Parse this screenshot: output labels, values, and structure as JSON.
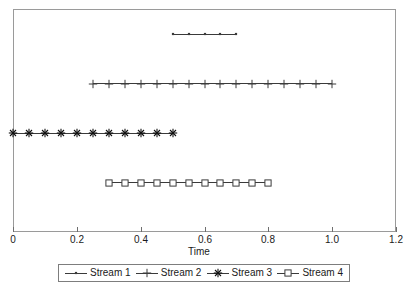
{
  "chart_data": {
    "type": "scatter",
    "title": "",
    "subtitle": "",
    "xlabel": "Time",
    "ylabel": "",
    "xlim": [
      0,
      1.2
    ],
    "ylim": [
      0,
      4.5
    ],
    "grid": false,
    "legend_position": "bottom",
    "x_ticks": [
      {
        "value": 0,
        "label": "0"
      },
      {
        "value": 0.2,
        "label": "0.2"
      },
      {
        "value": 0.4,
        "label": "0.4"
      },
      {
        "value": 0.6,
        "label": "0.6"
      },
      {
        "value": 0.8,
        "label": "0.8"
      },
      {
        "value": 1.0,
        "label": "1.0"
      },
      {
        "value": 1.2,
        "label": "1.2"
      }
    ],
    "y_ticks": [],
    "line_color": "#3a3a3a",
    "frame_color": "#9a9a9a",
    "series": [
      {
        "name": "Stream 1",
        "marker": "point",
        "y": 4,
        "x_start": 0.5,
        "x_end": 0.7,
        "x_step": 0.05,
        "x": [
          0.5,
          0.55,
          0.6,
          0.65,
          0.7
        ],
        "values": [
          4,
          4,
          4,
          4,
          4
        ]
      },
      {
        "name": "Stream 2",
        "marker": "plus",
        "y": 3,
        "x_start": 0.25,
        "x_end": 1.0,
        "x_step": 0.05,
        "x": [
          0.25,
          0.3,
          0.35,
          0.4,
          0.45,
          0.5,
          0.55,
          0.6,
          0.65,
          0.7,
          0.75,
          0.8,
          0.85,
          0.9,
          0.95,
          1.0
        ],
        "values": [
          3,
          3,
          3,
          3,
          3,
          3,
          3,
          3,
          3,
          3,
          3,
          3,
          3,
          3,
          3,
          3
        ]
      },
      {
        "name": "Stream 3",
        "marker": "asterisk",
        "y": 2,
        "x_start": 0.0,
        "x_end": 0.5,
        "x_step": 0.05,
        "x": [
          0.0,
          0.05,
          0.1,
          0.15,
          0.2,
          0.25,
          0.3,
          0.35,
          0.4,
          0.45,
          0.5
        ],
        "values": [
          2,
          2,
          2,
          2,
          2,
          2,
          2,
          2,
          2,
          2,
          2
        ]
      },
      {
        "name": "Stream 4",
        "marker": "square",
        "y": 1,
        "x_start": 0.3,
        "x_end": 0.8,
        "x_step": 0.05,
        "x": [
          0.3,
          0.35,
          0.4,
          0.45,
          0.5,
          0.55,
          0.6,
          0.65,
          0.7,
          0.75,
          0.8
        ],
        "values": [
          1,
          1,
          1,
          1,
          1,
          1,
          1,
          1,
          1,
          1,
          1
        ]
      }
    ],
    "legend": [
      {
        "label": "Stream 1",
        "marker": "point"
      },
      {
        "label": "Stream 2",
        "marker": "plus"
      },
      {
        "label": "Stream 3",
        "marker": "asterisk"
      },
      {
        "label": "Stream 4",
        "marker": "square"
      }
    ]
  }
}
